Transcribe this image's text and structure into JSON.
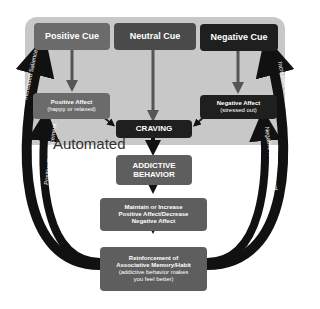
{
  "boxes": {
    "positive_cue": "Positive Cue",
    "neutral_cue": "Neutral Cue",
    "negative_cue": "Negative Cue",
    "positive_affect": "Positive Affect",
    "positive_affect_sub": "(happy or relaxed)",
    "negative_affect": "Negative Affect",
    "negative_affect_sub": "(stressed out)",
    "craving": "CRAVING",
    "addictive_behavior_1": "ADDICTIVE",
    "addictive_behavior_2": "BEHAVIOR",
    "maintain_1": "Maintain or Increase",
    "maintain_2": "Positive Affect/Decrease",
    "maintain_3": "Negative Affect",
    "reinforcement_1": "Reinforcement of",
    "reinforcement_2": "Associative Memory/Habit",
    "reinforcement_3": "(addictive behavior makes",
    "reinforcement_4": "you feel better)"
  },
  "labels": {
    "automated": "Automated",
    "increased_salience": "Increased Salience",
    "positive_reinforcement": "Positive Reinforcement",
    "negative_reinforcement": "Negative Reinforcement"
  },
  "colors": {
    "positive": "#6b6b6b",
    "neutral": "#4a4a4a",
    "negative": "#1f1f1f",
    "panel": "#c8c8c8"
  }
}
